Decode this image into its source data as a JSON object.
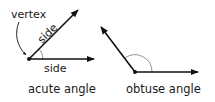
{
  "diagram": {
    "acute": {
      "vertex_label": "vertex",
      "side_diagonal_label": "side",
      "side_horizontal_label": "side",
      "caption": "acute angle",
      "vertex": [
        29,
        59
      ],
      "ray1_tip": [
        78,
        10
      ],
      "ray2_tip": [
        94,
        59
      ]
    },
    "obtuse": {
      "caption": "obtuse angle",
      "vertex": [
        135,
        72
      ],
      "ray1_tip": [
        101,
        27
      ],
      "ray2_tip": [
        198,
        72
      ]
    },
    "colors": {
      "line": "#111111",
      "arc": "#888888",
      "text": "#1a1a1a",
      "background": "#ffffff"
    }
  }
}
